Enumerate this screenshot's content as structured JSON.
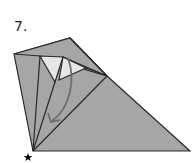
{
  "step": {
    "label": "7."
  },
  "diagram": {
    "type": "origami-fold-step",
    "colors": {
      "paper": "#a6a6a6",
      "flap": "#e6e6e6",
      "line": "#2a2a2a",
      "arrow": "#6e6e6e"
    },
    "reference_mark": "star"
  }
}
